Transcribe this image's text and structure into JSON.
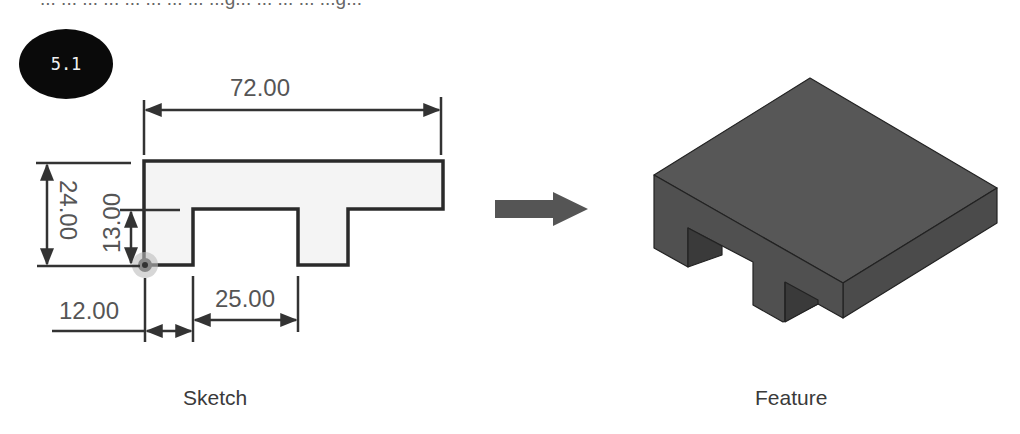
{
  "header": {
    "clipped_text": "... ... ... ... ... ... ... ... ...g... ... ... ... ...g..."
  },
  "badge": {
    "label": "5.1",
    "background": "#0a0a0a",
    "text_color": "#f0f0f0"
  },
  "sketch": {
    "caption": "Sketch",
    "dimensions": {
      "overall_width": "72.00",
      "overall_height": "24.00",
      "notch_height": "13.00",
      "left_offset": "12.00",
      "notch_width": "25.00"
    },
    "fill_color": "#f4f4f4",
    "line_color": "#2a2a2a"
  },
  "transition": {
    "arrow": "right-arrow",
    "color": "#555555"
  },
  "feature": {
    "caption": "Feature",
    "top_color": "#555555",
    "side_color": "#4a4a4a",
    "shadow_color": "#383838"
  }
}
